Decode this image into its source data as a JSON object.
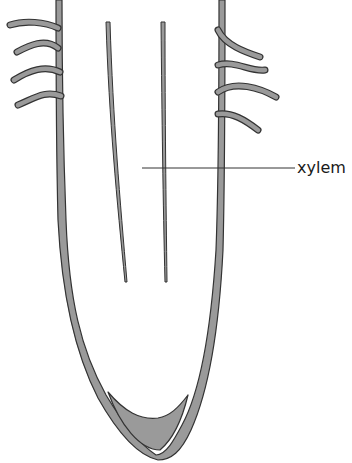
{
  "diagram": {
    "labels": [
      {
        "text": "xylem",
        "x": 297,
        "y": 160
      }
    ],
    "colors": {
      "fill": "#9a9a9a",
      "stroke": "#333333",
      "leader_line": "#333333"
    }
  }
}
